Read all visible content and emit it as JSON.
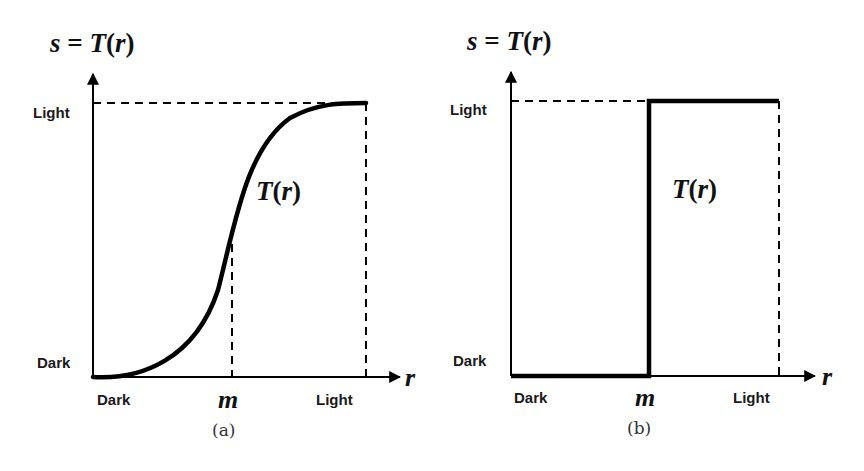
{
  "panels": [
    {
      "id": "a",
      "caption": "(a)",
      "y_axis_title": {
        "s": "s",
        "eq": " = ",
        "T": "T",
        "open": "(",
        "r": "r",
        "close": ")"
      },
      "x_axis_var": "r",
      "y_ticks": {
        "low": "Dark",
        "high": "Light"
      },
      "x_ticks": {
        "low": "Dark",
        "mid": "m",
        "high": "Light"
      },
      "curve_label": {
        "T": "T",
        "open": "(",
        "r": "r",
        "close": ")"
      },
      "curve_type": "sigmoid contrast stretching"
    },
    {
      "id": "b",
      "caption": "(b)",
      "y_axis_title": {
        "s": "s",
        "eq": " = ",
        "T": "T",
        "open": "(",
        "r": "r",
        "close": ")"
      },
      "x_axis_var": "r",
      "y_ticks": {
        "low": "Dark",
        "high": "Light"
      },
      "x_ticks": {
        "low": "Dark",
        "mid": "m",
        "high": "Light"
      },
      "curve_label": {
        "T": "T",
        "open": "(",
        "r": "r",
        "close": ")"
      },
      "curve_type": "thresholding step function"
    }
  ],
  "colors": {
    "line": "#000000",
    "text": "#1a1a1a",
    "caption": "#333333"
  }
}
